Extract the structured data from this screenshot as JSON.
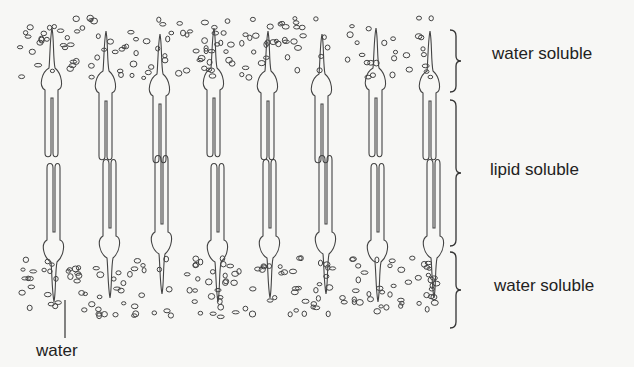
{
  "diagram": {
    "type": "membrane-bilayer-cross-section",
    "labels": {
      "top_region": "water soluble",
      "middle_region": "lipid soluble",
      "bottom_region": "water soluble",
      "pointer": "water"
    },
    "molecule_columns": 8,
    "stroke_color": "#444444",
    "background": "#f7f7f5"
  }
}
